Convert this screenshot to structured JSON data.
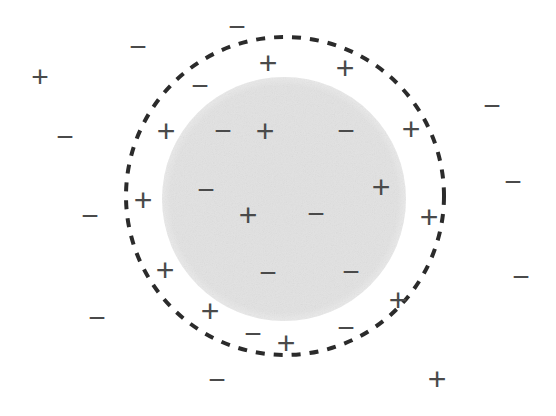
{
  "figure": {
    "background_color": "#ffffff",
    "symbol_color": "#4a4a4a",
    "dashed_circle": {
      "name": "gaussian-surface",
      "cx": 285,
      "cy": 196,
      "r": 159,
      "stroke_color": "#2b2b2b",
      "stroke_width": 4,
      "dash": "9 9"
    },
    "filled_circle": {
      "name": "charged-sphere",
      "cx": 284,
      "cy": 199,
      "r": 122,
      "fill_color": "#e8e8e8",
      "noise": true
    },
    "symbols": [
      {
        "sign": "+",
        "x": 40,
        "y": 77,
        "size": 30
      },
      {
        "sign": "−",
        "x": 138,
        "y": 47,
        "size": 30
      },
      {
        "sign": "−",
        "x": 65,
        "y": 137,
        "size": 30
      },
      {
        "sign": "−",
        "x": 237,
        "y": 27,
        "size": 30
      },
      {
        "sign": "+",
        "x": 268,
        "y": 63,
        "size": 32
      },
      {
        "sign": "+",
        "x": 345,
        "y": 68,
        "size": 32
      },
      {
        "sign": "−",
        "x": 200,
        "y": 86,
        "size": 30
      },
      {
        "sign": "−",
        "x": 492,
        "y": 106,
        "size": 30
      },
      {
        "sign": "+",
        "x": 166,
        "y": 131,
        "size": 32
      },
      {
        "sign": "−",
        "x": 223,
        "y": 131,
        "size": 30
      },
      {
        "sign": "+",
        "x": 265,
        "y": 131,
        "size": 32
      },
      {
        "sign": "−",
        "x": 346,
        "y": 131,
        "size": 30
      },
      {
        "sign": "+",
        "x": 411,
        "y": 129,
        "size": 32
      },
      {
        "sign": "−",
        "x": 206,
        "y": 190,
        "size": 30
      },
      {
        "sign": "+",
        "x": 381,
        "y": 187,
        "size": 32
      },
      {
        "sign": "−",
        "x": 513,
        "y": 182,
        "size": 30
      },
      {
        "sign": "+",
        "x": 143,
        "y": 200,
        "size": 32
      },
      {
        "sign": "−",
        "x": 90,
        "y": 216,
        "size": 30
      },
      {
        "sign": "+",
        "x": 248,
        "y": 215,
        "size": 32
      },
      {
        "sign": "−",
        "x": 316,
        "y": 214,
        "size": 30
      },
      {
        "sign": "+",
        "x": 429,
        "y": 217,
        "size": 32
      },
      {
        "sign": "−",
        "x": 268,
        "y": 273,
        "size": 30
      },
      {
        "sign": "−",
        "x": 351,
        "y": 272,
        "size": 30
      },
      {
        "sign": "+",
        "x": 165,
        "y": 270,
        "size": 32
      },
      {
        "sign": "−",
        "x": 521,
        "y": 277,
        "size": 30
      },
      {
        "sign": "+",
        "x": 398,
        "y": 300,
        "size": 32
      },
      {
        "sign": "+",
        "x": 210,
        "y": 311,
        "size": 32
      },
      {
        "sign": "−",
        "x": 97,
        "y": 318,
        "size": 30
      },
      {
        "sign": "−",
        "x": 253,
        "y": 334,
        "size": 30
      },
      {
        "sign": "−",
        "x": 346,
        "y": 328,
        "size": 30
      },
      {
        "sign": "+",
        "x": 286,
        "y": 343,
        "size": 32
      },
      {
        "sign": "−",
        "x": 217,
        "y": 380,
        "size": 30
      },
      {
        "sign": "+",
        "x": 437,
        "y": 379,
        "size": 32
      }
    ]
  }
}
